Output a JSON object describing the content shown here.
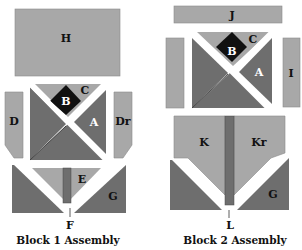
{
  "colors": {
    "light": "#a8a8a8",
    "medium": "#6e6e6e",
    "dark": "#111111",
    "background": "#ffffff"
  },
  "block1": {
    "caption": "Block 1 Assembly",
    "labels": {
      "H": "H",
      "B": "B",
      "C": "C",
      "A": "A",
      "D": "D",
      "Dr": "Dr",
      "E": "E",
      "G": "G",
      "F": "F"
    }
  },
  "block2": {
    "caption": "Block 2 Assembly",
    "labels": {
      "J": "J",
      "B": "B",
      "C": "C",
      "A": "A",
      "I": "I",
      "K": "K",
      "Kr": "Kr",
      "G": "G",
      "L": "L"
    }
  }
}
